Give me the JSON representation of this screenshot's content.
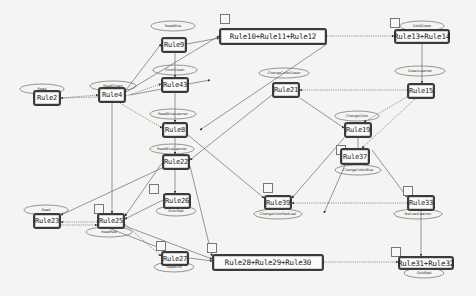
{
  "diagram": {
    "nodes": [
      {
        "id": "rule2",
        "label": "Rule2",
        "x": 33,
        "y": 90,
        "w": 28,
        "h": 16,
        "state": "Read"
      },
      {
        "id": "rule4",
        "label": "Rule4",
        "x": 98,
        "y": 87,
        "w": 28,
        "h": 16,
        "state": "ReadGreen"
      },
      {
        "id": "rule9",
        "label": "Rule9",
        "x": 161,
        "y": 37,
        "w": 26,
        "h": 16,
        "state": "ReadBlue"
      },
      {
        "id": "rule10_11_12",
        "label": "Rule10+Rule11+Rule12",
        "x": 219,
        "y": 28,
        "w": 108,
        "h": 17,
        "state": ""
      },
      {
        "id": "rule13_14",
        "label": "Rule13+Rule14",
        "x": 394,
        "y": 29,
        "w": 56,
        "h": 15,
        "state": "GoldGreen"
      },
      {
        "id": "rule43",
        "label": "Rule43",
        "x": 161,
        "y": 77,
        "w": 28,
        "h": 16,
        "state": "ErrorGreen"
      },
      {
        "id": "rule21",
        "label": "Rule21",
        "x": 272,
        "y": 82,
        "w": 28,
        "h": 16,
        "state": "ChangeColorGreen"
      },
      {
        "id": "rule15",
        "label": "Rule15",
        "x": 407,
        "y": 83,
        "w": 28,
        "h": 16,
        "state": "GreenLearner"
      },
      {
        "id": "rule8",
        "label": "Rule8",
        "x": 162,
        "y": 122,
        "w": 26,
        "h": 16,
        "state": "ReadBlueLearner"
      },
      {
        "id": "rule22",
        "label": "Rule22",
        "x": 162,
        "y": 154,
        "w": 28,
        "h": 16,
        "state": "ReadBlueLearner"
      },
      {
        "id": "rule19",
        "label": "Rule19",
        "x": 344,
        "y": 122,
        "w": 28,
        "h": 16,
        "state": "ChangeColor"
      },
      {
        "id": "rule37",
        "label": "Rule37",
        "x": 340,
        "y": 148,
        "w": 30,
        "h": 17,
        "state": "ChangeColorBlue"
      },
      {
        "id": "rule39",
        "label": "Rule39",
        "x": 264,
        "y": 195,
        "w": 28,
        "h": 15,
        "state": "ChangeColorRedLast"
      },
      {
        "id": "rule33",
        "label": "Rule33",
        "x": 407,
        "y": 195,
        "w": 28,
        "h": 16,
        "state": "NotLastLearner"
      },
      {
        "id": "rule26",
        "label": "Rule26",
        "x": 163,
        "y": 193,
        "w": 28,
        "h": 16,
        "state": "ErrorRed"
      },
      {
        "id": "rule23",
        "label": "Rule23",
        "x": 33,
        "y": 213,
        "w": 28,
        "h": 16,
        "state": "Read"
      },
      {
        "id": "rule25",
        "label": "Rule25",
        "x": 97,
        "y": 213,
        "w": 28,
        "h": 16,
        "state": "ReadRed"
      },
      {
        "id": "rule27",
        "label": "Rule27",
        "x": 161,
        "y": 251,
        "w": 28,
        "h": 15,
        "state": "ReadEnd"
      },
      {
        "id": "rule28_29_30",
        "label": "Rule28+Rule29+Rule30",
        "x": 212,
        "y": 254,
        "w": 112,
        "h": 17,
        "state": ""
      },
      {
        "id": "rule31_32",
        "label": "Rule31+Rule32",
        "x": 398,
        "y": 256,
        "w": 56,
        "h": 14,
        "state": "GoldRed"
      }
    ],
    "ellipses": [
      {
        "node": "rule2",
        "label": "Read",
        "cx": 42,
        "cy": 89,
        "rx": 22,
        "ry": 5
      },
      {
        "node": "rule4",
        "label": "ReadGreen",
        "cx": 113,
        "cy": 86,
        "rx": 23,
        "ry": 5
      },
      {
        "node": "rule9",
        "label": "ReadBlue",
        "cx": 173,
        "cy": 26,
        "rx": 22,
        "ry": 5
      },
      {
        "node": "rule13_14",
        "label": "GoldGreen",
        "cx": 422,
        "cy": 26,
        "rx": 22,
        "ry": 5
      },
      {
        "node": "rule43",
        "label": "ErrorGreen",
        "cx": 175,
        "cy": 70,
        "rx": 22,
        "ry": 5
      },
      {
        "node": "rule21",
        "label": "ChangeColorGreen",
        "cx": 284,
        "cy": 73,
        "rx": 25,
        "ry": 5
      },
      {
        "node": "rule15",
        "label": "GreenLearner",
        "cx": 420,
        "cy": 71,
        "rx": 25,
        "ry": 5
      },
      {
        "node": "rule8",
        "label": "ReadBlueLearner",
        "cx": 173,
        "cy": 114,
        "rx": 23,
        "ry": 5
      },
      {
        "node": "rule22",
        "label": "ReadBlueLearner",
        "cx": 172,
        "cy": 149,
        "rx": 22,
        "ry": 5
      },
      {
        "node": "rule19",
        "label": "ChangeColor",
        "cx": 357,
        "cy": 116,
        "rx": 22,
        "ry": 5
      },
      {
        "node": "rule37",
        "label": "ChangeColorBlue",
        "cx": 358,
        "cy": 170,
        "rx": 23,
        "ry": 5
      },
      {
        "node": "rule39",
        "label": "ChangeColorRedLast",
        "cx": 278,
        "cy": 214,
        "rx": 24,
        "ry": 5
      },
      {
        "node": "rule33",
        "label": "NotLastLearner",
        "cx": 418,
        "cy": 214,
        "rx": 24,
        "ry": 5
      },
      {
        "node": "rule26",
        "label": "ErrorRed",
        "cx": 176,
        "cy": 211,
        "rx": 20,
        "ry": 5
      },
      {
        "node": "rule23",
        "label": "Read",
        "cx": 46,
        "cy": 210,
        "rx": 22,
        "ry": 5
      },
      {
        "node": "rule25",
        "label": "ReadRed",
        "cx": 109,
        "cy": 232,
        "rx": 23,
        "ry": 5
      },
      {
        "node": "rule27",
        "label": "ReadEnd",
        "cx": 174,
        "cy": 267,
        "rx": 20,
        "ry": 5
      },
      {
        "node": "rule31_32",
        "label": "GoldRed",
        "cx": 424,
        "cy": 273,
        "rx": 20,
        "ry": 5
      }
    ],
    "edges": [
      {
        "from": [
          61,
          98
        ],
        "to": [
          98,
          95
        ],
        "style": "dotted"
      },
      {
        "from": [
          98,
          97
        ],
        "to": [
          61,
          98
        ],
        "style": "dotted"
      },
      {
        "from": [
          126,
          90
        ],
        "to": [
          161,
          44
        ],
        "style": "solid"
      },
      {
        "from": [
          126,
          92
        ],
        "to": [
          219,
          36
        ],
        "style": "solid"
      },
      {
        "from": [
          126,
          96
        ],
        "to": [
          161,
          84
        ],
        "style": "dotted"
      },
      {
        "from": [
          120,
          103
        ],
        "to": [
          162,
          128
        ],
        "style": "dotted"
      },
      {
        "from": [
          112,
          103
        ],
        "to": [
          112,
          213
        ],
        "style": "solid"
      },
      {
        "from": [
          187,
          44
        ],
        "to": [
          219,
          38
        ],
        "style": "solid"
      },
      {
        "from": [
          175,
          53
        ],
        "to": [
          175,
          77
        ],
        "style": "solid"
      },
      {
        "from": [
          327,
          36
        ],
        "to": [
          394,
          36
        ],
        "style": "dotted"
      },
      {
        "from": [
          327,
          44
        ],
        "to": [
          200,
          130
        ],
        "style": "solid"
      },
      {
        "from": [
          422,
          44
        ],
        "to": [
          422,
          83
        ],
        "style": "solid"
      },
      {
        "from": [
          407,
          90
        ],
        "to": [
          300,
          90
        ],
        "style": "dotted"
      },
      {
        "from": [
          407,
          97
        ],
        "to": [
          364,
          122
        ],
        "style": "dotted"
      },
      {
        "from": [
          415,
          99
        ],
        "to": [
          362,
          148
        ],
        "style": "dotted"
      },
      {
        "from": [
          300,
          98
        ],
        "to": [
          344,
          128
        ],
        "style": "solid"
      },
      {
        "from": [
          272,
          95
        ],
        "to": [
          190,
          160
        ],
        "style": "solid"
      },
      {
        "from": [
          175,
          93
        ],
        "to": [
          175,
          122
        ],
        "style": "solid"
      },
      {
        "from": [
          175,
          138
        ],
        "to": [
          175,
          154
        ],
        "style": "solid"
      },
      {
        "from": [
          188,
          135
        ],
        "to": [
          264,
          198
        ],
        "style": "solid"
      },
      {
        "from": [
          175,
          170
        ],
        "to": [
          175,
          193
        ],
        "style": "solid"
      },
      {
        "from": [
          162,
          163
        ],
        "to": [
          125,
          216
        ],
        "style": "solid"
      },
      {
        "from": [
          162,
          168
        ],
        "to": [
          61,
          215
        ],
        "style": "solid"
      },
      {
        "from": [
          163,
          200
        ],
        "to": [
          125,
          219
        ],
        "style": "solid"
      },
      {
        "from": [
          344,
          138
        ],
        "to": [
          292,
          198
        ],
        "style": "solid"
      },
      {
        "from": [
          345,
          165
        ],
        "to": [
          324,
          213
        ],
        "style": "solid"
      },
      {
        "from": [
          372,
          150
        ],
        "to": [
          407,
          197
        ],
        "style": "solid"
      },
      {
        "from": [
          407,
          203
        ],
        "to": [
          292,
          203
        ],
        "style": "dotted"
      },
      {
        "from": [
          358,
          165
        ],
        "to": [
          358,
          122
        ],
        "style": "solid"
      },
      {
        "from": [
          421,
          211
        ],
        "to": [
          421,
          256
        ],
        "style": "solid"
      },
      {
        "from": [
          97,
          222
        ],
        "to": [
          61,
          222
        ],
        "style": "dotted"
      },
      {
        "from": [
          61,
          225
        ],
        "to": [
          97,
          225
        ],
        "style": "dotted"
      },
      {
        "from": [
          125,
          224
        ],
        "to": [
          161,
          256
        ],
        "style": "dotted"
      },
      {
        "from": [
          125,
          226
        ],
        "to": [
          212,
          259
        ],
        "style": "solid"
      },
      {
        "from": [
          111,
          229
        ],
        "to": [
          160,
          248
        ],
        "style": "solid"
      },
      {
        "from": [
          189,
          258
        ],
        "to": [
          212,
          261
        ],
        "style": "solid"
      },
      {
        "from": [
          190,
          166
        ],
        "to": [
          212,
          256
        ],
        "style": "solid"
      },
      {
        "from": [
          324,
          262
        ],
        "to": [
          398,
          262
        ],
        "style": "dotted"
      },
      {
        "from": [
          130,
          95
        ],
        "to": [
          210,
          80
        ],
        "style": "solid"
      }
    ],
    "self_loop_squares": [
      {
        "x": 220,
        "y": 14
      },
      {
        "x": 390,
        "y": 18
      },
      {
        "x": 94,
        "y": 204
      },
      {
        "x": 149,
        "y": 184
      },
      {
        "x": 156,
        "y": 241
      },
      {
        "x": 207,
        "y": 243
      },
      {
        "x": 263,
        "y": 183
      },
      {
        "x": 336,
        "y": 145
      },
      {
        "x": 403,
        "y": 186
      },
      {
        "x": 391,
        "y": 247
      }
    ],
    "colors": {
      "background": "#f4f4f2",
      "node_border": "#3a3a3a",
      "edge": "#6a6a6a",
      "ellipse": "#7a7a7a"
    }
  }
}
